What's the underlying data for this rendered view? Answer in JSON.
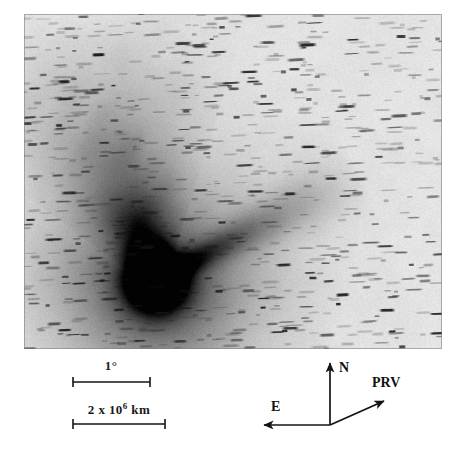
{
  "figure": {
    "kind": "astronomical-plate",
    "plate": {
      "x": 24,
      "y": 14,
      "width": 418,
      "height": 335,
      "background_hex": "#f2f1ef",
      "ink_hex": "#141414",
      "coma": {
        "cx": 0.315,
        "cy": 0.795,
        "core_radius": 0.062,
        "halo_radius": 0.175
      },
      "tail": {
        "direction_deg": 108,
        "opening_deg": 52,
        "length": 0.86,
        "ray_angle_deg": 28,
        "ray_length": 0.55
      },
      "star_trails": {
        "count": 780,
        "trail_min_px": 5,
        "trail_max_px": 20,
        "trail_thickness_px": 2,
        "tilt_deg": -2
      }
    }
  },
  "scale_bars": [
    {
      "id": "angular-scale",
      "label": "1°",
      "label_x": 111,
      "label_y": 358,
      "bar_x1": 73,
      "bar_x2": 150,
      "bar_y": 382,
      "tick_height": 10
    },
    {
      "id": "linear-scale",
      "label_prefix": "2 x 10",
      "label_exponent": "6",
      "label_suffix": " km",
      "label_plain": "2 x 10^6 km",
      "label_x": 119,
      "label_y": 401,
      "bar_x1": 73,
      "bar_x2": 165,
      "bar_y": 424,
      "tick_height": 10
    }
  ],
  "compass": {
    "origin_x": 330,
    "origin_y": 425,
    "arrows": [
      {
        "id": "north",
        "label": "N",
        "to_x": 330,
        "to_y": 363,
        "label_x": 339,
        "label_y": 360
      },
      {
        "id": "east",
        "label": "E",
        "to_x": 264,
        "to_y": 425,
        "label_x": 271,
        "label_y": 399
      },
      {
        "id": "prv",
        "label": "PRV",
        "to_x": 384,
        "to_y": 401,
        "label_x": 372,
        "label_y": 375
      }
    ]
  },
  "colors": {
    "page_background": "#ffffff",
    "plate_paper": "#f2f1ef",
    "ink": "#141414",
    "annotation": "#111111"
  }
}
